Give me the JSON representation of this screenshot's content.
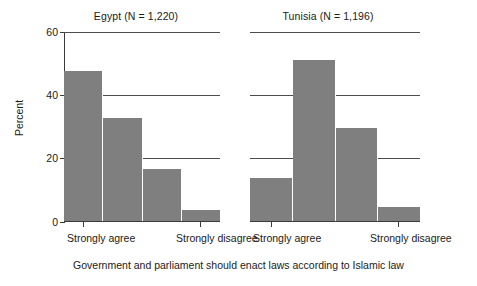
{
  "chart_data": {
    "type": "bar",
    "title": "",
    "xlabel": "Government and parliament should enact laws according to Islamic law",
    "ylabel": "Percent",
    "ylim": [
      0,
      60
    ],
    "yticks": [
      0,
      20,
      40,
      60
    ],
    "ytick_labels": [
      "0",
      "20",
      "40",
      "60"
    ],
    "grid": "horizontal",
    "legend": "none",
    "categories": [
      "Strongly agree",
      "Agree",
      "Disagree",
      "Strongly disagree"
    ],
    "xtick_labels": [
      "Strongly agree",
      "Strongly disagree"
    ],
    "panels": [
      {
        "name": "Egypt",
        "title": "Egypt (N = 1,220)",
        "n": "1,220",
        "values": [
          47.5,
          32.5,
          16.5,
          3.5
        ]
      },
      {
        "name": "Tunisia",
        "title": "Tunisia (N = 1,196)",
        "n": "1,196",
        "values": [
          13.5,
          51.0,
          29.5,
          4.5
        ]
      }
    ],
    "bar_color": "#7f7f7f",
    "axis_color": "#3a3a3a",
    "gridline_color": "#4d4d4d",
    "background": "#ffffff"
  }
}
